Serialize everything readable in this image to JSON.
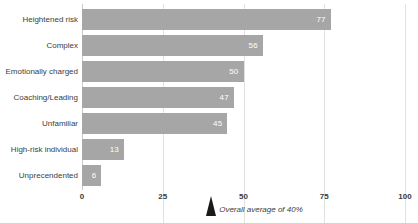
{
  "chart_data": {
    "type": "bar",
    "orientation": "horizontal",
    "title": "",
    "xlabel": "",
    "ylabel": "",
    "categories": [
      "Heightened risk",
      "Complex",
      "Emotionally charged",
      "Coaching/Leading",
      "Unfamiliar",
      "High-risk individual",
      "Unprecendented"
    ],
    "values": [
      77,
      56,
      50,
      47,
      45,
      13,
      6
    ],
    "value_labels": [
      "77",
      "56",
      "50",
      "47",
      "45",
      "13",
      "6"
    ],
    "xlim": [
      0,
      100
    ],
    "xticks": [
      0,
      25,
      50,
      75,
      100
    ],
    "xtick_labels": [
      "0",
      "25",
      "50",
      "75",
      "100"
    ],
    "grid": "vertical",
    "legend": "none",
    "annotations": [
      {
        "name": "overall-average",
        "text": "Overall average of 40%",
        "value": 40,
        "marker": "triangle-up"
      }
    ],
    "colors": {
      "bar": "#a6a6a6",
      "bar_value_text": "#ffffff",
      "category_text": "#404040",
      "tick_text": "#3b3b3b",
      "gridline": "#e2e2e2",
      "axis": "#c9c9c9",
      "marker": "#1a1a1a",
      "background": "#ffffff"
    }
  }
}
